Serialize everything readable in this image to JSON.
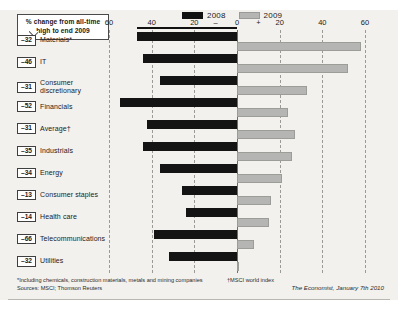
{
  "callout": {
    "line1": "% change from all-time",
    "line2": "high to end 2009"
  },
  "legend": [
    {
      "label": "2008",
      "color": "#141414"
    },
    {
      "label": "2009",
      "color": "#b5b5b3"
    }
  ],
  "footnotes": {
    "note_star": "*Including chemicals, construction materials, metals and mining companies",
    "note_dagger": "†MSCI world index",
    "sources": "Sources: MSCI; Thomson Reuters"
  },
  "credit": "The Economist, January 7th 2010",
  "chart_data": {
    "type": "bar",
    "title": "",
    "xlabel": "% change",
    "ylabel": "",
    "orientation": "horizontal",
    "diverging": true,
    "xlim": [
      -60,
      60
    ],
    "xticks": [
      -60,
      -40,
      -20,
      0,
      20,
      40,
      60
    ],
    "xtick_labels": [
      "60",
      "40",
      "20",
      "0",
      "20",
      "40",
      "60"
    ],
    "sign_markers": {
      "negative": "–",
      "positive": "+"
    },
    "grid": true,
    "legend_position": "top-center",
    "categories": [
      "Materials*",
      "IT",
      "Consumer discretionary",
      "Financials",
      "Average†",
      "Industrials",
      "Energy",
      "Consumer staples",
      "Health care",
      "Telecommunications",
      "Utilities"
    ],
    "change_from_high": [
      -32,
      -46,
      -31,
      -52,
      -31,
      -35,
      -34,
      -13,
      -14,
      -66,
      -32
    ],
    "series": [
      {
        "name": "2008",
        "values": [
          -47,
          -44,
          -36,
          -55,
          -42,
          -44,
          -36,
          -26,
          -24,
          -39,
          -32
        ]
      },
      {
        "name": "2009",
        "values": [
          58,
          52,
          33,
          24,
          27,
          26,
          21,
          16,
          15,
          8,
          1
        ]
      }
    ]
  }
}
